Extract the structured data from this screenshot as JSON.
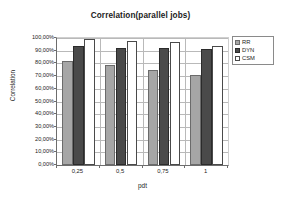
{
  "chart_data": {
    "type": "bar",
    "title": "Correlation(parallel jobs)",
    "xlabel": "pdt",
    "ylabel": "Correlation",
    "categories": [
      "0,25",
      "0,5",
      "0,75",
      "1"
    ],
    "series": [
      {
        "name": "RR",
        "color": "#a6a6a6",
        "values": [
          82.0,
          79.0,
          74.5,
          70.5
        ]
      },
      {
        "name": "DYN",
        "color": "#4a4a4a",
        "values": [
          93.5,
          92.5,
          92.5,
          91.5
        ]
      },
      {
        "name": "CSM",
        "color": "#ffffff",
        "values": [
          99.5,
          98.0,
          96.5,
          94.0
        ]
      }
    ],
    "ylim": [
      0,
      100
    ],
    "ytick_labels": [
      "100,00%",
      "90,00%",
      "80,00%",
      "70,00%",
      "60,00%",
      "50,00%",
      "40,00%",
      "30,00%",
      "20,00%",
      "10,00%",
      "0,00%"
    ],
    "ytick_values": [
      100,
      90,
      80,
      70,
      60,
      50,
      40,
      30,
      20,
      10,
      0
    ],
    "grid": true,
    "legend_position": "top-right",
    "value_suffix": "%"
  }
}
